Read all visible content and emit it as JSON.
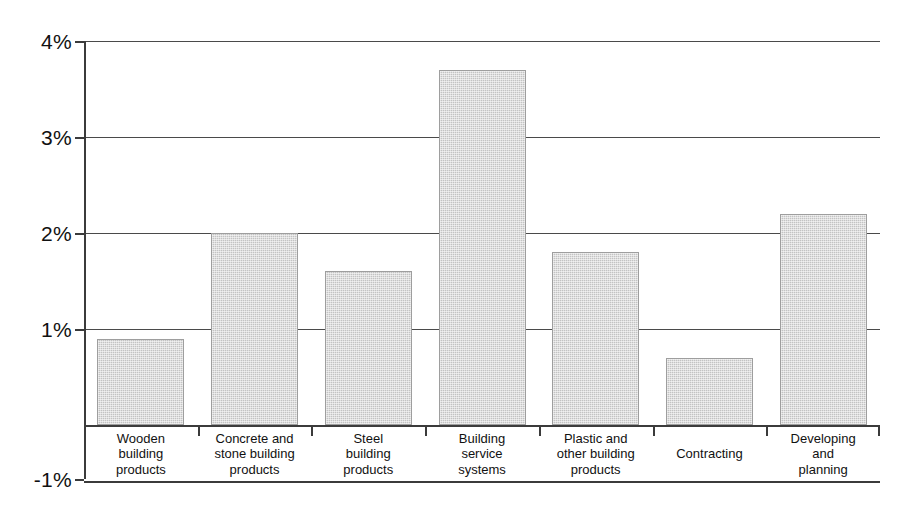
{
  "chart_data": {
    "type": "bar",
    "title": "",
    "subtitle": "",
    "xlabel": "",
    "ylabel": "",
    "categories": [
      "Wooden building products",
      "Concrete and stone building products",
      "Steel building products",
      "Building service systems",
      "Plastic and other building products",
      "Contracting",
      "Developing and planning"
    ],
    "category_lines": [
      [
        "Wooden",
        "building",
        "products"
      ],
      [
        "Concrete and",
        "stone building",
        "products"
      ],
      [
        "Steel",
        "building",
        "products"
      ],
      [
        "Building",
        "service",
        "systems"
      ],
      [
        "Plastic and",
        "other building",
        "products"
      ],
      [
        "Contracting"
      ],
      [
        "Developing",
        "and",
        "planning"
      ]
    ],
    "values": [
      0.9,
      2.0,
      1.6,
      3.7,
      1.8,
      0.7,
      2.2
    ],
    "value_unit": "%",
    "ylim": [
      -1,
      4
    ],
    "yticks": [
      -1,
      0,
      1,
      2,
      3,
      4
    ],
    "ytick_labels": [
      "-1%",
      "",
      "1%",
      "2%",
      "3%",
      "4%"
    ],
    "gridlines": [
      1,
      2,
      3,
      4
    ],
    "grid": true,
    "legend": null,
    "legend_position": "none",
    "bar_color": "#c3c3c3",
    "bar_edge_color": "#9e9e9e",
    "axis_color": "#3b3b3b",
    "background_color": "#ffffff"
  },
  "axis": {
    "ticks": [
      {
        "label": "4%",
        "value": 4
      },
      {
        "label": "3%",
        "value": 3
      },
      {
        "label": "2%",
        "value": 2
      },
      {
        "label": "1%",
        "value": 1
      },
      {
        "label": "-1%",
        "value": -1
      }
    ]
  }
}
